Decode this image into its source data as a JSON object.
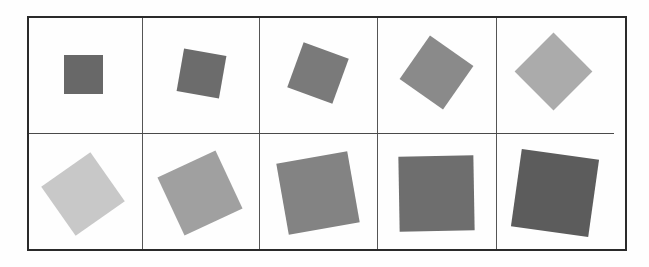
{
  "figure": {
    "grid": {
      "rows": 2,
      "columns": 5,
      "frame_color": "#2a2a2a",
      "divider_color": "#555555"
    },
    "squares": [
      {
        "cx": 83,
        "cy": 74,
        "size": 39,
        "rotation": 0,
        "color": "#686868"
      },
      {
        "cx": 201,
        "cy": 73,
        "size": 43,
        "rotation": 10,
        "color": "#6c6c6c"
      },
      {
        "cx": 318,
        "cy": 73,
        "size": 48,
        "rotation": 20,
        "color": "#7a7a7a"
      },
      {
        "cx": 436,
        "cy": 72,
        "size": 53,
        "rotation": 35,
        "color": "#8a8a8a"
      },
      {
        "cx": 553,
        "cy": 71,
        "size": 55,
        "rotation": 45,
        "color": "#ababab"
      },
      {
        "cx": 83,
        "cy": 194,
        "size": 60,
        "rotation": -35,
        "color": "#c8c8c8"
      },
      {
        "cx": 200,
        "cy": 193,
        "size": 64,
        "rotation": -25,
        "color": "#a0a0a0"
      },
      {
        "cx": 318,
        "cy": 193,
        "size": 72,
        "rotation": -10,
        "color": "#838383"
      },
      {
        "cx": 436,
        "cy": 193,
        "size": 75,
        "rotation": -1,
        "color": "#6e6e6e"
      },
      {
        "cx": 555,
        "cy": 193,
        "size": 78,
        "rotation": 8,
        "color": "#5c5c5c"
      }
    ]
  }
}
